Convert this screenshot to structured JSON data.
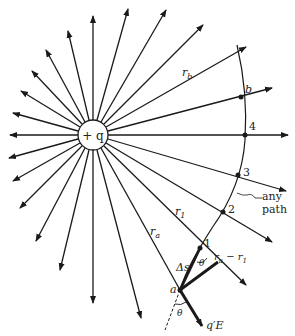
{
  "figure": {
    "center": {
      "x": 93,
      "y": 135,
      "radius": 15
    },
    "charge_label": "+ q",
    "colors": {
      "line": "#1a1a1a",
      "background": "#ffffff"
    }
  },
  "labels": {
    "r_b": "r",
    "r_b_sub": "b",
    "r_1": "r",
    "r_1_sub": "1",
    "r_a": "r",
    "r_a_sub": "a",
    "point_b": "b",
    "point_4": "4",
    "point_3": "3",
    "point_2": "2",
    "point_1": "1",
    "point_a": "a",
    "any_path_1": "any",
    "any_path_2": "path",
    "diff_r": "r",
    "diff_r_sub1": "a",
    "diff_r_mid": " − r",
    "diff_r_sub2": "1",
    "delta_s": "Δs",
    "theta_1": "θ",
    "theta_2": "θ",
    "force": "q′E"
  },
  "points": [
    {
      "name": "b",
      "x": 241,
      "y": 97
    },
    {
      "name": "4",
      "x": 245,
      "y": 135
    },
    {
      "name": "3",
      "x": 238,
      "y": 175
    },
    {
      "name": "2",
      "x": 223,
      "y": 212
    },
    {
      "name": "1",
      "x": 200,
      "y": 248
    },
    {
      "name": "a",
      "x": 180,
      "y": 290
    }
  ]
}
